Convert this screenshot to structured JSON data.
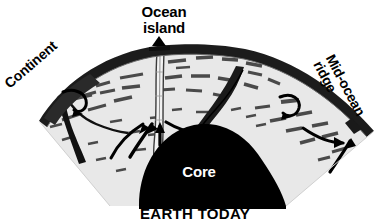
{
  "figure": {
    "title": "EARTH TODAY",
    "type": "geological-cross-section",
    "caption": "EARTH TODAY",
    "background_color": "#ffffff"
  },
  "labels": {
    "ocean_island": "Ocean\nisland",
    "ocean_island_line1": "Ocean",
    "ocean_island_line2": "island",
    "continent": "Continent",
    "mid_ocean_ridge": "Mid-ocean\nridge",
    "mid_ocean_ridge_line1": "Mid-ocean",
    "mid_ocean_ridge_line2": "ridge",
    "core": "Core",
    "earth_today": "EARTH TODAY"
  },
  "colors": {
    "mantle_fill": "#e8e8e8",
    "crust_dark": "#1a1a1a",
    "core_black": "#000000",
    "label_black": "#000000",
    "label_white": "#ffffff",
    "dash_gray": "#555555",
    "plume_fill": "#f2f2f2",
    "background": "#ffffff"
  },
  "features": [
    {
      "name": "mantle-wedge",
      "description": "light gray fan-shaped mantle cross-section"
    },
    {
      "name": "crust-arc",
      "description": "dark lithosphere band along the top arc"
    },
    {
      "name": "core",
      "description": "black dome at the base labeled Core"
    },
    {
      "name": "mantle-plume",
      "description": "narrow vertical column from core to ocean island"
    },
    {
      "name": "subducting-slab-left",
      "description": "dark slab descending beneath the continent"
    },
    {
      "name": "subducting-slab-right",
      "description": "dark slab descending on the right flank"
    },
    {
      "name": "convection-arrows",
      "description": "curved black flow arrows in the mantle"
    },
    {
      "name": "flow-dashes",
      "description": "dashed gray lines indicating mantle flow"
    }
  ]
}
